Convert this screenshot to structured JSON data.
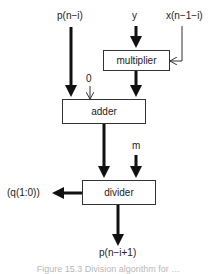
{
  "diagram": {
    "inputs": {
      "p": "p(n−i)",
      "y": "y",
      "x": "x(n−1−i)",
      "zero": "0",
      "m": "m"
    },
    "blocks": {
      "multiplier": "multiplier",
      "adder": "adder",
      "divider": "divider"
    },
    "outputs": {
      "q": "(q(1:0))",
      "p_next": "p(n−i+1)"
    },
    "caption": "Figure 15.3  Division algorithm for …"
  }
}
